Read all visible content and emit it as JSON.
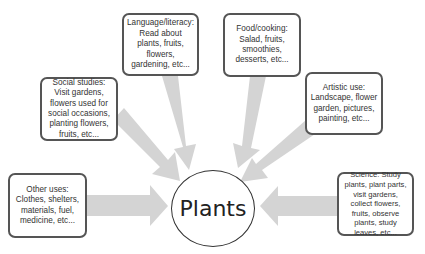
{
  "diagram": {
    "center": {
      "label": "Plants"
    },
    "nodes": [
      {
        "id": "language",
        "text": "Language/literacy: Read about plants, fruits, flowers, gardening, etc..."
      },
      {
        "id": "food",
        "text": "Food/cooking:  Salad, fruits, smoothies, desserts, etc..."
      },
      {
        "id": "social",
        "text": "Social studies: Visit gardens, flowers used for social occasions, planting flowers, fruits, etc..."
      },
      {
        "id": "artistic",
        "text": "Artistic use: Landscape, flower garden, pictures, painting, etc..."
      },
      {
        "id": "other",
        "text": "Other uses:  Clothes, shelters, materials, fuel, medicine, etc..."
      },
      {
        "id": "science",
        "text": "Science:  Study plants, plant parts, visit gardens, collect flowers, fruits, observe plants, study leaves, etc..."
      }
    ],
    "colors": {
      "arrow": "#d4d4d4",
      "border": "#555555",
      "text": "#333333"
    }
  }
}
